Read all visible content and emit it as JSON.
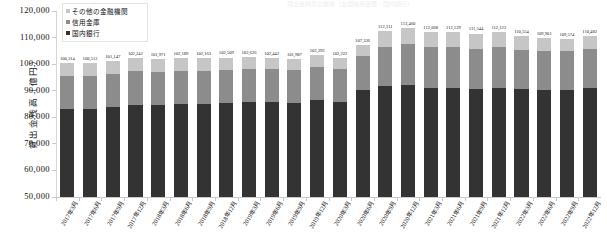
{
  "top_strip_text": "貸出金残高の推移（全国信用金庫・国内銀行）",
  "axis": {
    "y_title": "貸出金残高（億円）",
    "y_ticks": [
      "120,000",
      "110,000",
      "100,000",
      "90,000",
      "80,000",
      "70,000",
      "60,000",
      "50,000"
    ],
    "y_min": 50000,
    "y_max": 120000
  },
  "legend": {
    "items": [
      {
        "label": "その他の金融機関",
        "color": "#c6c6c6",
        "key": "other"
      },
      {
        "label": "信用金庫",
        "color": "#8c8c8c",
        "key": "shinkin"
      },
      {
        "label": "国内銀行",
        "color": "#333333",
        "key": "bank"
      }
    ]
  },
  "chart_data": {
    "type": "bar",
    "stacked": true,
    "title": "貸出金残高の推移（全国信用金庫・国内銀行）",
    "xlabel": "",
    "ylabel": "貸出金残高（億円）",
    "ylim": [
      50000,
      120000
    ],
    "ytick_step": 10000,
    "grid": false,
    "legend_position": "top-left",
    "categories": [
      "2017年3月",
      "2017年6月",
      "2017年9月",
      "2017年12月",
      "2018年3月",
      "2018年6月",
      "2018年9月",
      "2018年12月",
      "2019年3月",
      "2019年6月",
      "2019年9月",
      "2019年12月",
      "2020年3月",
      "2020年6月",
      "2020年9月",
      "2020年12月",
      "2021年3月",
      "2021年6月",
      "2021年9月",
      "2021年12月",
      "2022年3月",
      "2022年6月",
      "2022年9月",
      "2022年12月"
    ],
    "totals": [
      100314,
      100512,
      101147,
      102241,
      101971,
      102189,
      102163,
      102509,
      102626,
      102442,
      101987,
      103393,
      102222,
      107336,
      112311,
      113460,
      112068,
      112129,
      111544,
      112122,
      110554,
      109901,
      109574,
      110482
    ],
    "series": [
      {
        "name": "国内銀行",
        "key": "bank",
        "color": "#333333",
        "values": [
          83100,
          83300,
          83900,
          84800,
          84700,
          85000,
          85100,
          85400,
          85700,
          85700,
          85500,
          86500,
          85900,
          90400,
          91600,
          92100,
          91200,
          91100,
          90700,
          91100,
          90600,
          90400,
          90300,
          91000
        ]
      },
      {
        "name": "信用金庫",
        "key": "shinkin",
        "color": "#8c8c8c",
        "values": [
          12400,
          12300,
          12300,
          12500,
          12400,
          12400,
          12300,
          12400,
          12400,
          12300,
          12200,
          12400,
          12200,
          12600,
          14800,
          15400,
          15100,
          15200,
          15100,
          15200,
          14900,
          14700,
          14600,
          14700
        ]
      },
      {
        "name": "その他の金融機関",
        "key": "other",
        "color": "#c6c6c6",
        "values": [
          4814,
          4912,
          4947,
          4941,
          4871,
          4789,
          4763,
          4709,
          4526,
          4442,
          4287,
          4493,
          4122,
          4336,
          5911,
          5960,
          5768,
          5829,
          5744,
          5822,
          5054,
          4801,
          4674,
          4782
        ]
      }
    ],
    "data_labels": [
      "100,314",
      "100,512",
      "101,147",
      "102,241",
      "101,971",
      "102,189",
      "102,163",
      "102,509",
      "102,626",
      "102,442",
      "101,987",
      "103,393",
      "102,222",
      "107,336",
      "112,311",
      "113,460",
      "112,068",
      "112,129",
      "111,544",
      "112,122",
      "110,554",
      "109,901",
      "109,574",
      "110,482"
    ]
  }
}
